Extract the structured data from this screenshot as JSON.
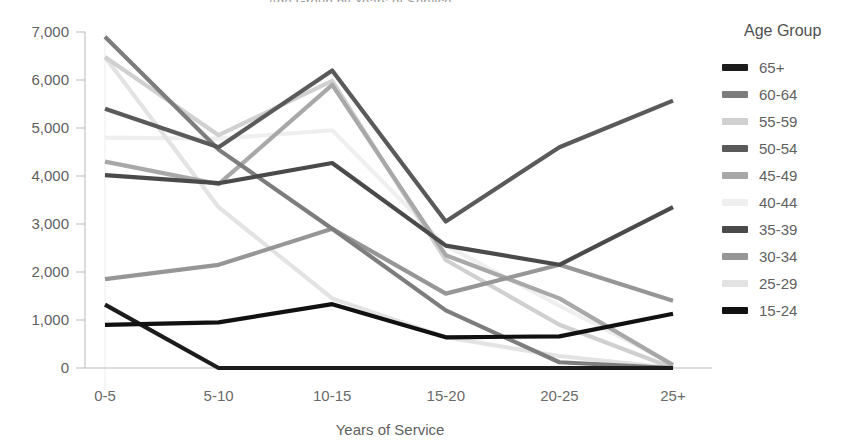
{
  "title_clipped": "Age Group by Years of Service",
  "legend": {
    "title": "Age Group",
    "position": "right"
  },
  "chart_data": {
    "type": "line",
    "title": "Age Group by Years of Service",
    "xlabel": "Years of Service",
    "ylabel": "",
    "categories": [
      "0-5",
      "5-10",
      "10-15",
      "15-20",
      "20-25",
      "25+"
    ],
    "ylim": [
      0,
      7000
    ],
    "ytick_labels": [
      "0",
      "1,000",
      "2,000",
      "3,000",
      "4,000",
      "5,000",
      "6,000",
      "7,000"
    ],
    "ytick_values": [
      0,
      1000,
      2000,
      3000,
      4000,
      5000,
      6000,
      7000
    ],
    "grid": false,
    "legend_position": "right",
    "series": [
      {
        "name": "65+",
        "color": "#1c1c1c",
        "values": [
          1320,
          0,
          0,
          0,
          0,
          0
        ]
      },
      {
        "name": "60-64",
        "color": "#7d7d7d",
        "values": [
          6900,
          4550,
          2900,
          1200,
          120,
          0
        ]
      },
      {
        "name": "55-59",
        "color": "#d0d0d0",
        "values": [
          6480,
          4850,
          5980,
          2250,
          900,
          0
        ]
      },
      {
        "name": "50-54",
        "color": "#5a5a5a",
        "values": [
          5400,
          4600,
          6200,
          3050,
          4600,
          5570
        ]
      },
      {
        "name": "45-49",
        "color": "#a8a8a8",
        "values": [
          4300,
          3830,
          5900,
          2350,
          1450,
          60
        ]
      },
      {
        "name": "40-44",
        "color": "#efefef",
        "values": [
          4800,
          4780,
          4950,
          2550,
          1300,
          80
        ]
      },
      {
        "name": "35-39",
        "color": "#4a4a4a",
        "values": [
          4020,
          3850,
          4270,
          2550,
          2150,
          3350
        ]
      },
      {
        "name": "30-34",
        "color": "#969696",
        "values": [
          1850,
          2150,
          2900,
          1550,
          2150,
          1400
        ]
      },
      {
        "name": "25-29",
        "color": "#e3e3e3",
        "values": [
          6480,
          3350,
          1450,
          640,
          250,
          0
        ]
      },
      {
        "name": "15-24",
        "color": "#111111",
        "values": [
          900,
          950,
          1330,
          640,
          660,
          1130
        ]
      }
    ]
  }
}
